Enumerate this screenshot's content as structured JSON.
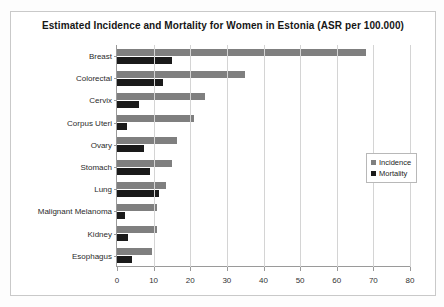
{
  "chart_data": {
    "type": "bar",
    "orientation": "horizontal",
    "title": "Estimated Incidence and Mortality for Women in Estonia (ASR per 100.000)",
    "xlabel": "",
    "ylabel": "",
    "xlim": [
      0,
      80
    ],
    "xticks": [
      0,
      10,
      20,
      30,
      40,
      50,
      60,
      70,
      80
    ],
    "grid": true,
    "legend_position": "right",
    "categories": [
      "Breast",
      "Colorectal",
      "Cervix",
      "Corpus Uteri",
      "Ovary",
      "Stomach",
      "Lung",
      "Malignant Melanoma",
      "Kidney",
      "Esophagus"
    ],
    "series": [
      {
        "name": "Incidence",
        "color": "#7f7f7f",
        "values": [
          68,
          35,
          24,
          21,
          16.5,
          15,
          13.5,
          11,
          11,
          9.5
        ]
      },
      {
        "name": "Mortality",
        "color": "#1a1a1a",
        "values": [
          15,
          12.5,
          6,
          2.7,
          7.5,
          9,
          11.5,
          2.2,
          3,
          4
        ]
      }
    ]
  },
  "legend": {
    "items": [
      {
        "label": "Incidence",
        "color": "#7f7f7f"
      },
      {
        "label": "Mortality",
        "color": "#1a1a1a"
      }
    ]
  }
}
